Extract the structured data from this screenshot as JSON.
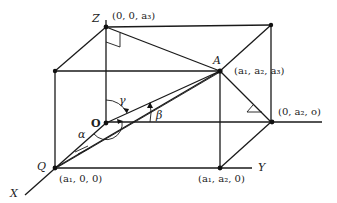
{
  "diagram": {
    "colors": {
      "line": "#1a1a1a",
      "text": "#222222",
      "background": "#ffffff"
    },
    "axes": {
      "x_label": "X",
      "y_label": "Y",
      "z_label": "Z"
    },
    "points": {
      "origin": {
        "label": "O"
      },
      "A": {
        "label": "A",
        "coords": "(a₁, a₂, a₃)"
      },
      "Q": {
        "label": "Q",
        "coords": "(a₁, 0, 0)"
      },
      "z_point": {
        "coords": "(0, 0, a₃)"
      },
      "y_point": {
        "coords": "(0, a₂, o)"
      },
      "xy_point": {
        "coords": "(a₁, a₂, 0)"
      }
    },
    "angles": {
      "alpha": "α",
      "beta": "β",
      "gamma": "γ"
    }
  }
}
